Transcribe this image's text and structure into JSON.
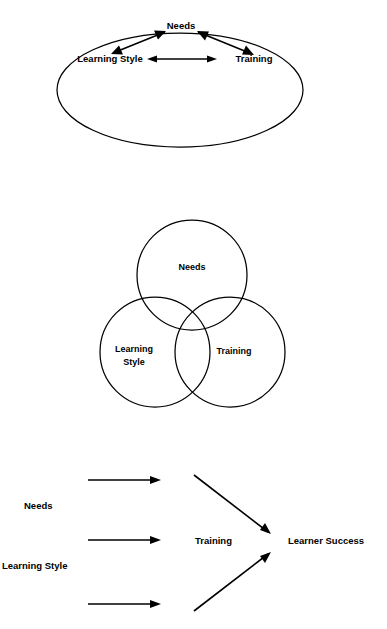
{
  "page": {
    "background_color": "#ffffff",
    "ink_color": "#000000",
    "width": 387,
    "height": 629
  },
  "figures": [
    {
      "id": "ellipse-triad",
      "name": "Interrelationship Triangle in Ellipse",
      "shape": "ellipse",
      "nodes": [
        {
          "label": "Needs"
        },
        {
          "label": "Learning Style"
        },
        {
          "label": "Training"
        }
      ],
      "connections": [
        {
          "from": "Needs",
          "to": "Learning Style",
          "style": "double-headed"
        },
        {
          "from": "Needs",
          "to": "Training",
          "style": "double-headed"
        },
        {
          "from": "Learning Style",
          "to": "Training",
          "style": "double-headed"
        }
      ]
    },
    {
      "id": "venn-triad",
      "name": "Three Circle Venn Diagram",
      "shape": "venn",
      "circles": [
        {
          "label": "Needs",
          "position": "top"
        },
        {
          "label_line1": "Learning",
          "label_line2": "Style",
          "position": "bottom-left"
        },
        {
          "label": "Training",
          "position": "bottom-right"
        }
      ]
    },
    {
      "id": "flow-inputs-outcome",
      "name": "Inputs to Learner Success Flow",
      "shape": "flow",
      "inputs": [
        {
          "label": "Needs"
        },
        {
          "label": "Learning Style"
        }
      ],
      "process": {
        "label": "Training"
      },
      "outcome": {
        "label": "Learner Success"
      },
      "arrows": [
        {
          "type": "horizontal",
          "index": 1
        },
        {
          "type": "horizontal",
          "index": 2
        },
        {
          "type": "horizontal",
          "index": 3
        },
        {
          "type": "diagonal-down-right",
          "from": "top",
          "to": "Learner Success"
        },
        {
          "type": "diagonal-up-right",
          "from": "bottom",
          "to": "Learner Success"
        }
      ]
    }
  ],
  "labels": {
    "needs": "Needs",
    "learning_style": "Learning Style",
    "learning": "Learning",
    "style": "Style",
    "training": "Training",
    "learner_success": "Learner Success"
  }
}
